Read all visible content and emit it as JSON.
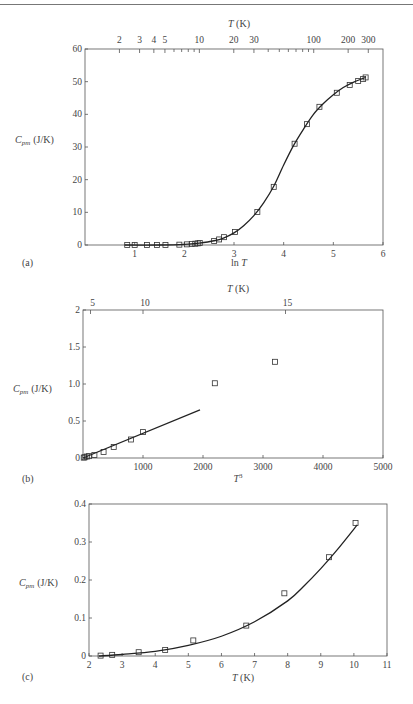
{
  "page": {
    "top_rule": true
  },
  "chart_data": [
    {
      "id": "a",
      "panel_label": "(a)",
      "type": "scatter",
      "title": "",
      "xlabel": "ln T",
      "ylabel": "Cpm (J/K)",
      "top_axis_label": "T (K)",
      "xlim": [
        0,
        6
      ],
      "ylim": [
        0,
        60
      ],
      "x_ticks": [
        1,
        2,
        3,
        4,
        5,
        6
      ],
      "y_ticks": [
        0,
        10,
        20,
        30,
        40,
        50,
        60
      ],
      "top_ticks_labeled": [
        2,
        3,
        4,
        5,
        10,
        20,
        30,
        100,
        200,
        300
      ],
      "top_ticks_minor": [
        6,
        7,
        8,
        9,
        40,
        50,
        60,
        70,
        80,
        90
      ],
      "grid": false,
      "series": [
        {
          "name": "measured",
          "marker": "square",
          "x": [
            0.85,
            1.0,
            1.25,
            1.45,
            1.62,
            1.9,
            2.05,
            2.15,
            2.22,
            2.27,
            2.31,
            2.6,
            2.7,
            2.8,
            3.02,
            3.47,
            3.8,
            4.22,
            4.47,
            4.72,
            5.07,
            5.33,
            5.5,
            5.6,
            5.65
          ],
          "y": [
            0,
            0,
            0,
            0,
            0,
            0.1,
            0.2,
            0.3,
            0.4,
            0.5,
            0.6,
            1.2,
            1.7,
            2.4,
            4.0,
            10.1,
            17.8,
            31.0,
            37.0,
            42.3,
            46.6,
            49.0,
            50.2,
            50.8,
            51.3
          ]
        },
        {
          "name": "fit",
          "style": "line",
          "x": [
            0.8,
            1.5,
            2.0,
            2.3,
            2.6,
            2.8,
            3.0,
            3.2,
            3.4,
            3.6,
            3.8,
            4.0,
            4.2,
            4.4,
            4.6,
            4.8,
            5.0,
            5.2,
            5.4,
            5.6,
            5.65
          ],
          "y": [
            0,
            0,
            0.2,
            0.6,
            1.3,
            2.2,
            3.7,
            6.0,
            9.0,
            13.0,
            18.0,
            24.5,
            30.5,
            35.5,
            40.0,
            43.3,
            46.0,
            48.2,
            49.8,
            51.0,
            51.3
          ]
        }
      ]
    },
    {
      "id": "b",
      "panel_label": "(b)",
      "type": "scatter",
      "title": "",
      "xlabel": "T³",
      "ylabel": "Cpm (J/K)",
      "top_axis_label": "T (K)",
      "xlim": [
        0,
        5000
      ],
      "ylim": [
        0,
        2
      ],
      "x_ticks": [
        1000,
        2000,
        3000,
        4000,
        5000
      ],
      "y_ticks": [
        0,
        0.5,
        1.0,
        1.5,
        2
      ],
      "y_tick_labels": [
        "0",
        "0.5",
        "1.0",
        "1.5",
        "2"
      ],
      "top_ticks": [
        5,
        10,
        15
      ],
      "grid": false,
      "series": [
        {
          "name": "measured",
          "marker": "square",
          "x": [
            12,
            27,
            64,
            100,
            190,
            343,
            512,
            800,
            1000,
            2197,
            3200
          ],
          "y": [
            0.005,
            0.01,
            0.02,
            0.025,
            0.04,
            0.08,
            0.15,
            0.25,
            0.35,
            1.01,
            1.3
          ]
        },
        {
          "name": "fit",
          "style": "line",
          "x": [
            0,
            1950
          ],
          "y": [
            0,
            0.65
          ]
        }
      ]
    },
    {
      "id": "c",
      "panel_label": "(c)",
      "type": "scatter",
      "title": "",
      "xlabel": "T (K)",
      "ylabel": "Cpm (J/K)",
      "xlim": [
        2,
        11
      ],
      "ylim": [
        0,
        0.4
      ],
      "x_ticks": [
        2,
        3,
        4,
        5,
        6,
        7,
        8,
        9,
        10,
        11
      ],
      "y_ticks": [
        0,
        0.1,
        0.2,
        0.3,
        0.4
      ],
      "y_tick_labels": [
        "0",
        "0.1",
        "0.2",
        "0.3",
        "0.4"
      ],
      "grid": false,
      "series": [
        {
          "name": "measured",
          "marker": "square",
          "x": [
            2.35,
            2.7,
            3.5,
            4.3,
            5.15,
            6.75,
            7.9,
            9.25,
            10.05
          ],
          "y": [
            0.001,
            0.003,
            0.01,
            0.016,
            0.041,
            0.08,
            0.165,
            0.26,
            0.35
          ]
        },
        {
          "name": "fit",
          "style": "line",
          "x": [
            2.3,
            3,
            4,
            5,
            6,
            7,
            8,
            8.5,
            9,
            9.5,
            10.1
          ],
          "y": [
            0.0,
            0.004,
            0.012,
            0.028,
            0.052,
            0.09,
            0.145,
            0.185,
            0.23,
            0.28,
            0.345
          ]
        }
      ]
    }
  ]
}
